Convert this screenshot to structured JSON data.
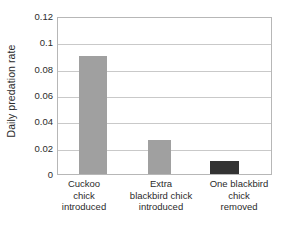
{
  "chart_data": {
    "type": "bar",
    "title": "",
    "xlabel": "",
    "ylabel": "Daily predation rate",
    "categories": [
      "Cuckoo\nchick\nintroduced",
      "Extra\nblackbird chick\nintroduced",
      "One blackbird\nchick\nremoved"
    ],
    "values": [
      0.09,
      0.026,
      0.01
    ],
    "bar_colors": [
      "#a0a0a0",
      "#a0a0a0",
      "#333333"
    ],
    "ylim": [
      0,
      0.12
    ],
    "yticks": [
      0,
      0.02,
      0.04,
      0.06,
      0.08,
      0.1,
      0.12
    ],
    "ytick_labels": [
      "0",
      "0.02",
      "0.04",
      "0.06",
      "0.08",
      "0.1",
      "0.12"
    ],
    "grid": true,
    "grid_axis": "y",
    "legend": null,
    "legend_position": "none",
    "frame_color": "#b7b7b7",
    "grid_color": "#c9c9c9",
    "background": "#ffffff",
    "text_color": "#2b2b2b"
  }
}
